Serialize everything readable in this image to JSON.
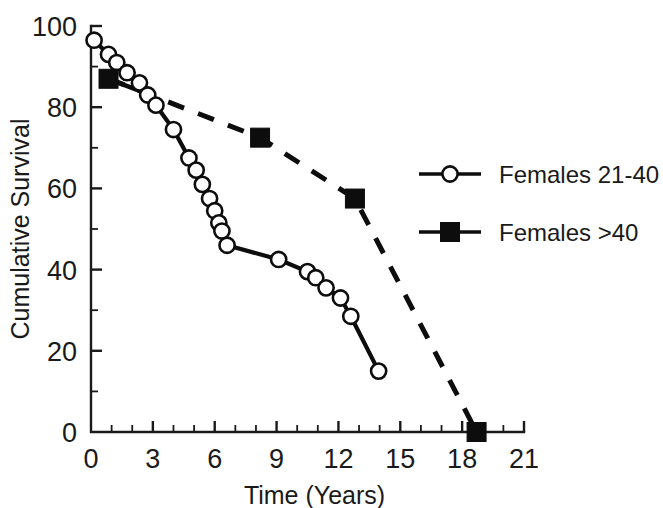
{
  "chart_data": {
    "type": "line",
    "title": "",
    "xlabel": "Time (Years)",
    "ylabel": "Cumulative Survival",
    "xlim": [
      0,
      21
    ],
    "ylim": [
      0,
      100
    ],
    "x_ticks": [
      0,
      3,
      6,
      9,
      12,
      15,
      18,
      21
    ],
    "x_tick_labels": [
      "0",
      "3",
      "6",
      "9",
      "12",
      "15",
      "18",
      "21"
    ],
    "x_minor_interval": 1,
    "y_ticks": [
      0,
      20,
      40,
      60,
      80,
      100
    ],
    "y_tick_labels": [
      "0",
      "20",
      "40",
      "60",
      "80",
      "100"
    ],
    "y_minor_interval": 10,
    "grid": false,
    "legend_position": "right",
    "series": [
      {
        "name": "Females 21-40",
        "marker": "open-circle",
        "linestyle": "solid",
        "color": "#0d0d0d",
        "points": [
          {
            "x": 0.15,
            "y": 96.5
          },
          {
            "x": 0.85,
            "y": 93.0
          },
          {
            "x": 1.25,
            "y": 91.0
          },
          {
            "x": 1.75,
            "y": 88.5
          },
          {
            "x": 2.35,
            "y": 86.0
          },
          {
            "x": 2.75,
            "y": 83.0
          },
          {
            "x": 3.15,
            "y": 80.5
          },
          {
            "x": 4.0,
            "y": 74.5
          },
          {
            "x": 4.75,
            "y": 67.5
          },
          {
            "x": 5.1,
            "y": 64.5
          },
          {
            "x": 5.4,
            "y": 61.0
          },
          {
            "x": 5.75,
            "y": 57.5
          },
          {
            "x": 6.0,
            "y": 54.5
          },
          {
            "x": 6.2,
            "y": 51.5
          },
          {
            "x": 6.35,
            "y": 49.5
          },
          {
            "x": 6.6,
            "y": 46.0
          },
          {
            "x": 9.1,
            "y": 42.5
          },
          {
            "x": 10.5,
            "y": 39.5
          },
          {
            "x": 10.9,
            "y": 38.0
          },
          {
            "x": 11.4,
            "y": 35.5
          },
          {
            "x": 12.1,
            "y": 33.0
          },
          {
            "x": 12.6,
            "y": 28.5
          },
          {
            "x": 13.95,
            "y": 15.0
          }
        ]
      },
      {
        "name": "Females >40",
        "marker": "filled-square",
        "linestyle": "dashed",
        "color": "#0d0d0d",
        "points": [
          {
            "x": 0.85,
            "y": 87.0
          },
          {
            "x": 8.2,
            "y": 72.5
          },
          {
            "x": 12.8,
            "y": 57.5
          },
          {
            "x": 18.7,
            "y": 0.0
          }
        ]
      }
    ]
  },
  "legend": {
    "entries": [
      {
        "label": "Females 21-40",
        "marker": "open-circle"
      },
      {
        "label": "Females >40",
        "marker": "filled-square"
      }
    ]
  }
}
